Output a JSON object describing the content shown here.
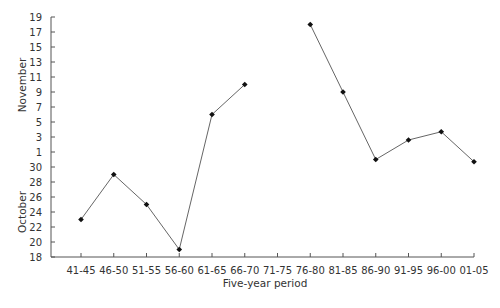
{
  "chart_data": {
    "type": "line",
    "title": "",
    "xlabel": "Five-year period",
    "ylabel_upper": "November",
    "ylabel_lower": "October",
    "y_unit": "day index (October day number; November days continue as 31 + day)",
    "ylim": [
      18,
      50
    ],
    "grid": false,
    "legend": null,
    "categories": [
      "41-45",
      "46-50",
      "51-55",
      "56-60",
      "61-65",
      "66-70",
      "71-75",
      "76-80",
      "81-85",
      "86-90",
      "91-95",
      "96-00",
      "01-05"
    ],
    "y_ticks": [
      {
        "value": 18,
        "label": "18"
      },
      {
        "value": 20,
        "label": "20"
      },
      {
        "value": 22,
        "label": "22"
      },
      {
        "value": 24,
        "label": "24"
      },
      {
        "value": 26,
        "label": "26"
      },
      {
        "value": 28,
        "label": "28"
      },
      {
        "value": 30,
        "label": "30"
      },
      {
        "value": 32,
        "label": "1"
      },
      {
        "value": 34,
        "label": "3"
      },
      {
        "value": 36,
        "label": "5"
      },
      {
        "value": 38,
        "label": "7"
      },
      {
        "value": 40,
        "label": "9"
      },
      {
        "value": 42,
        "label": "11"
      },
      {
        "value": 44,
        "label": "13"
      },
      {
        "value": 46,
        "label": "15"
      },
      {
        "value": 48,
        "label": "17"
      },
      {
        "value": 50,
        "label": "19"
      }
    ],
    "series": [
      {
        "name": "Date",
        "values": [
          23,
          29,
          25,
          19,
          37,
          41,
          null,
          49,
          40,
          31,
          33.6,
          34.7,
          30.7
        ],
        "dates": [
          "Oct 23",
          "Oct 29",
          "Oct 25",
          "Oct 19",
          "Nov 6",
          "Nov 10",
          null,
          "Nov 18",
          "Nov 9",
          "Oct 31",
          "Nov 3",
          "Nov 4",
          "Oct 31"
        ]
      }
    ]
  }
}
